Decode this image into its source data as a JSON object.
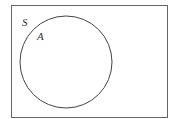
{
  "diagram": {
    "type": "venn",
    "universal_set": {
      "label": "S"
    },
    "sets": [
      {
        "label": "A"
      }
    ],
    "colors": {
      "stroke": "#555555",
      "background": "#ffffff",
      "text": "#333333"
    }
  }
}
